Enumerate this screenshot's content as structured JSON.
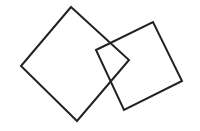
{
  "canvas": {
    "width": 200,
    "height": 131,
    "background": "#ffffff"
  },
  "style": {
    "stroke": "#222222",
    "stroke_width": 2,
    "fill": "none"
  },
  "shapes": [
    {
      "name": "left-square",
      "type": "polygon",
      "points": [
        [
          71,
          7
        ],
        [
          129,
          60
        ],
        [
          77,
          121
        ],
        [
          21,
          66
        ]
      ]
    },
    {
      "name": "right-square",
      "type": "polygon",
      "points": [
        [
          96,
          50
        ],
        [
          153,
          22
        ],
        [
          182,
          81
        ],
        [
          124,
          110
        ]
      ]
    }
  ]
}
